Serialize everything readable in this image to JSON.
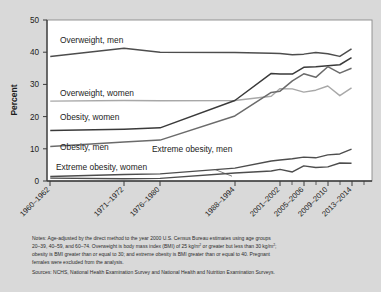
{
  "figure": {
    "background_color": "#d9d9d9",
    "plot_background_color": "#ffffff",
    "y_axis_title": "Percent"
  },
  "chart_data": {
    "type": "line",
    "title": "",
    "xlabel": "",
    "ylabel": "Percent",
    "ylim": [
      0,
      50
    ],
    "yticks": [
      0,
      10,
      20,
      30,
      40,
      50
    ],
    "ytick_labels": [
      "0",
      "10",
      "20",
      "30",
      "40",
      "50"
    ],
    "grid": false,
    "legend_position": "inline-labels",
    "x": [
      "1960-1962",
      "1971-1974",
      "1976-1980",
      "1988-1994",
      "1999-2000",
      "2001-2002",
      "2003-2004",
      "2005-2006",
      "2007-2008",
      "2009-2010",
      "2011-2012",
      "2013-2014"
    ],
    "xtick_labels": [
      "1960–1962",
      "1971–1972",
      "1976–1980",
      "1988–1994",
      "2001–2002",
      "2005–2006",
      "2009–2010",
      "2013–2014"
    ],
    "series": [
      {
        "name": "Overweight, men",
        "color": "#4d4d4d",
        "label": "Overweight, men",
        "values": [
          38.7,
          41.2,
          40.0,
          39.9,
          39.7,
          39.6,
          39.2,
          39.4,
          39.9,
          39.5,
          38.7,
          41.0
        ]
      },
      {
        "name": "Overweight, women",
        "color": "#a8a8a8",
        "label": "Overweight, women",
        "values": [
          24.8,
          25.0,
          24.9,
          25.0,
          26.3,
          28.7,
          28.6,
          27.6,
          28.2,
          29.5,
          26.5,
          28.9
        ]
      },
      {
        "name": "Obesity, women",
        "color": "#3a3a3a",
        "label": "Obesity, women",
        "values": [
          15.7,
          16.1,
          16.5,
          25.0,
          33.4,
          33.2,
          33.2,
          35.3,
          35.5,
          35.8,
          36.1,
          38.3
        ]
      },
      {
        "name": "Obesity, men",
        "color": "#6b6b6b",
        "label": "Obesity, men",
        "values": [
          10.7,
          12.1,
          12.7,
          20.2,
          27.5,
          27.9,
          31.1,
          33.3,
          32.2,
          35.5,
          33.5,
          35.0
        ]
      },
      {
        "name": "Extreme obesity, men",
        "color": "#4d4d4d",
        "label": "Extreme obesity, men",
        "values": [
          0.9,
          0.7,
          0.8,
          2.5,
          3.1,
          3.6,
          2.8,
          4.7,
          4.2,
          4.4,
          5.6,
          5.5
        ]
      },
      {
        "name": "Extreme obesity, women",
        "color": "#4d4d4d",
        "label": "Extreme obesity, women",
        "values": [
          1.4,
          2.0,
          2.2,
          4.0,
          6.2,
          6.5,
          6.9,
          7.4,
          7.2,
          8.1,
          8.4,
          9.9
        ]
      }
    ]
  },
  "notes": {
    "line1_a": "Notes: Age-adjusted by the direct method to the year 2000 U.S. Census Bureau estimates using age groups",
    "line2_a": "20–39, 40–59, and 60–74. Overweight is body mass index (BMI) of 25 kg/m",
    "line2_sup1": "2",
    "line2_b": " or greater but less than 30 kg/m",
    "line2_sup2": "2",
    "line2_c": ";",
    "line3_a": "obesity is BMI greater than or equal to 30; and extreme obesity is BMI greater than or equal to 40. Pregnant",
    "line4_a": "females were excluded from the analysis.",
    "line5_a": "Sources: NCHS, National Health Examination Survey and National Health and Nutrition Examination Surveys."
  }
}
